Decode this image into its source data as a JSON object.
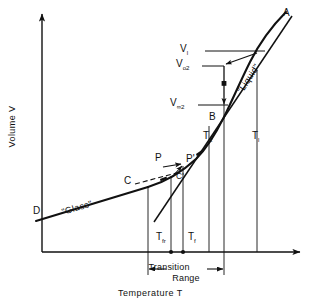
{
  "figure": {
    "type": "diagram",
    "axes": {
      "y_label": "Volume  V",
      "x_label": "Temperature  T"
    },
    "regions": [
      {
        "name": "glass-region",
        "label": "\"Glass\""
      },
      {
        "name": "liquid-region",
        "label": "\"Liquid\""
      }
    ],
    "curve_points": [
      {
        "name": "point-a",
        "label": "A"
      },
      {
        "name": "point-b",
        "label": "B"
      },
      {
        "name": "point-c",
        "label": "C"
      },
      {
        "name": "point-d",
        "label": "D"
      },
      {
        "name": "point-p",
        "label": "P"
      },
      {
        "name": "point-p-prime",
        "label": "P'"
      },
      {
        "name": "point-c-prime",
        "label": "C'"
      }
    ],
    "volume_labels": [
      {
        "name": "v-l",
        "base": "V",
        "subscript": "l"
      },
      {
        "name": "v-o2",
        "base": "V",
        "subscript": "o2"
      },
      {
        "name": "v-inf2",
        "base": "V",
        "subscript": "∞2"
      }
    ],
    "temperature_labels": [
      {
        "name": "t-fr",
        "base": "T",
        "subscript": "fr"
      },
      {
        "name": "t-f",
        "base": "T",
        "subscript": "f"
      },
      {
        "name": "t-2",
        "base": "T",
        "subscript": "2"
      },
      {
        "name": "t-l",
        "base": "T",
        "subscript": "l"
      }
    ],
    "annotation": {
      "transition_range_line1": "Transition",
      "transition_range_line2": "Range"
    },
    "colors": {
      "ink": "#111111",
      "background": "#ffffff",
      "dashed": "#111111"
    }
  }
}
